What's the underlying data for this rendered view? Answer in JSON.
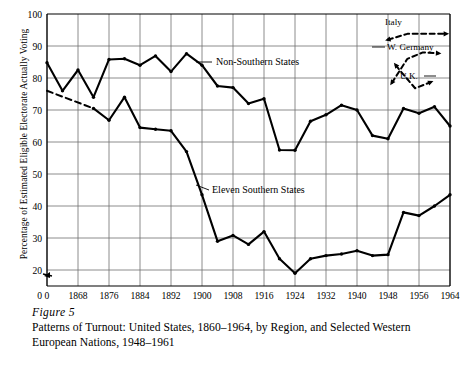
{
  "figure": {
    "number_label": "Figure 5",
    "caption": "Patterns of Turnout: United States, 1860–1964, by Region, and Selected Western European Nations, 1948–1961"
  },
  "chart_data": {
    "type": "line",
    "title": "",
    "xlabel": "",
    "ylabel": "Percentage of Estimated Eligible Electorate Actually Voting",
    "xlim": [
      1860,
      1964
    ],
    "ylim": [
      0,
      100
    ],
    "grid": true,
    "legend_position": "inline-annotations",
    "y_ticks": [
      0,
      20,
      30,
      40,
      50,
      60,
      70,
      80,
      90,
      100
    ],
    "y_tick_labels": [
      "0",
      "20",
      "30",
      "40",
      "50",
      "60",
      "70",
      "80",
      "90",
      "100"
    ],
    "x_origin_label": "0",
    "x_ticks": [
      1868,
      1876,
      1884,
      1892,
      1900,
      1908,
      1916,
      1924,
      1932,
      1940,
      1948,
      1956,
      1964
    ],
    "x_tick_labels": [
      "1868",
      "1876",
      "1884",
      "1892",
      "1900",
      "1908",
      "1916",
      "1924",
      "1932",
      "1940",
      "1948",
      "1956",
      "1964"
    ],
    "axis_break_marker": true,
    "series": [
      {
        "name": "Non-Southern States",
        "label": "Non-Southern States",
        "style": "solid",
        "x": [
          1860,
          1864,
          1868,
          1872,
          1876,
          1880,
          1884,
          1888,
          1892,
          1896,
          1900,
          1904,
          1908,
          1912,
          1916,
          1920,
          1924,
          1928,
          1932,
          1936,
          1940,
          1944,
          1948,
          1952,
          1956,
          1960,
          1964
        ],
        "values": [
          84.8,
          76.0,
          82.5,
          74.0,
          85.8,
          86.0,
          84.0,
          86.9,
          82.0,
          87.6,
          84.0,
          77.5,
          77.0,
          72.0,
          73.5,
          57.5,
          57.4,
          66.5,
          68.5,
          71.5,
          70.0,
          62.0,
          61.0,
          70.5,
          69.0,
          71.0,
          65.0
        ]
      },
      {
        "name": "Eleven Southern States",
        "label": "Eleven Southern States",
        "style": "solid-with-dashed-start",
        "dashed_segment_x": [
          1860,
          1872
        ],
        "x": [
          1860,
          1872,
          1876,
          1880,
          1884,
          1888,
          1892,
          1896,
          1900,
          1904,
          1908,
          1912,
          1916,
          1920,
          1924,
          1928,
          1932,
          1936,
          1940,
          1944,
          1948,
          1952,
          1956,
          1960,
          1964
        ],
        "values": [
          76.0,
          70.5,
          66.8,
          74.0,
          64.5,
          64.0,
          63.5,
          57.0,
          43.5,
          29.0,
          30.8,
          28.0,
          32.0,
          23.5,
          19.0,
          23.5,
          24.5,
          25.0,
          26.0,
          24.5,
          24.8,
          38.0,
          37.0,
          40.0,
          43.5
        ]
      }
    ],
    "euro_series": [
      {
        "name": "Italy",
        "label": "Italy",
        "style": "dashed",
        "x": [
          1948,
          1953,
          1958,
          1963
        ],
        "values": [
          92.0,
          93.8,
          93.8,
          93.8
        ]
      },
      {
        "name": "W. Germany",
        "label": "W. Germany",
        "style": "dashed",
        "x": [
          1949,
          1953,
          1957,
          1961
        ],
        "values": [
          78.5,
          86.0,
          88.0,
          87.7
        ]
      },
      {
        "name": "U.K.",
        "label": "U.K.",
        "style": "dashed",
        "x": [
          1950,
          1951,
          1955,
          1959
        ],
        "values": [
          84.0,
          82.5,
          76.8,
          78.7
        ]
      }
    ],
    "annotations": [
      {
        "text": "Non-Southern States",
        "points_to_series": "Non-Southern States"
      },
      {
        "text": "Eleven Southern States",
        "points_to_series": "Eleven Southern States"
      },
      {
        "text": "Italy",
        "points_to_series": "Italy"
      },
      {
        "text": "W. Germany",
        "points_to_series": "W. Germany"
      },
      {
        "text": "U.K.",
        "points_to_series": "U.K."
      }
    ],
    "colors": {
      "line": "#000000",
      "grid": "#6e6e6e",
      "axis": "#000000",
      "background": "#ffffff"
    }
  }
}
